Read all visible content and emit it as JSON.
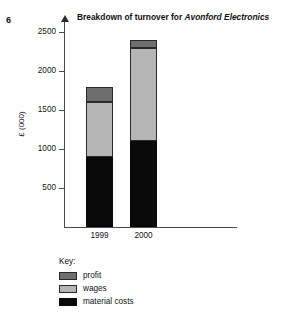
{
  "question_number": "6",
  "title": {
    "prefix": "Breakdown of turnover for ",
    "emphasis": "Avonford Electronics"
  },
  "legend": {
    "heading": "Key:",
    "entries": [
      {
        "label": "profit",
        "color": "#6e6e6e"
      },
      {
        "label": "wages",
        "color": "#b5b5b5"
      },
      {
        "label": "material costs",
        "color": "#0a0a0a"
      }
    ]
  },
  "axis": {
    "y_caption": "£ (000)",
    "y_ticks": [
      "500",
      "1000",
      "1500",
      "2000",
      "2500"
    ],
    "x_labels": [
      "1999",
      "2000"
    ]
  },
  "chart_data": {
    "type": "bar",
    "stacked": true,
    "title": "Breakdown of turnover for Avonford Electronics",
    "xlabel": "",
    "ylabel": "£ (000)",
    "ylim": [
      0,
      2600
    ],
    "yticks": [
      500,
      1000,
      1500,
      2000,
      2500
    ],
    "grid": false,
    "legend_position": "below-left",
    "categories": [
      "1999",
      "2000"
    ],
    "series": [
      {
        "name": "material costs",
        "color": "#0a0a0a",
        "values": [
          900,
          1100
        ]
      },
      {
        "name": "wages",
        "color": "#b5b5b5",
        "values": [
          700,
          1200
        ]
      },
      {
        "name": "profit",
        "color": "#6e6e6e",
        "values": [
          200,
          100
        ]
      }
    ],
    "totals": [
      1800,
      2400
    ],
    "segment_tops": {
      "1999": {
        "material costs": 900,
        "wages": 1600,
        "profit": 1800
      },
      "2000": {
        "material costs": 1100,
        "wages": 2300,
        "profit": 2400
      }
    }
  }
}
